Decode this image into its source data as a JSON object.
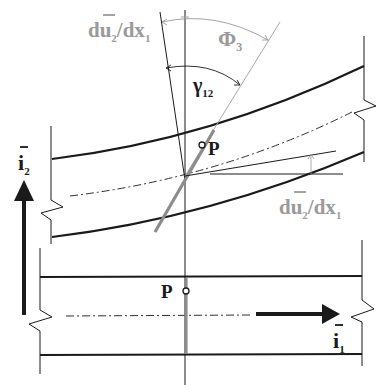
{
  "diagram": {
    "colors": {
      "line_dark": "#1a1a1a",
      "line_gray": "#9a9a9a",
      "normal_gray": "#8c8c8c",
      "background": "#ffffff"
    },
    "labels": {
      "slope_top": {
        "base": "du",
        "sub": "2",
        "rest": "/dx",
        "sub2": "1"
      },
      "slope_right": {
        "base": "du",
        "sub": "2",
        "rest": "/dx",
        "sub2": "1"
      },
      "phi": {
        "base": "Φ",
        "sub": "3"
      },
      "gamma": {
        "base": "γ",
        "sub": "12"
      },
      "point_deformed": "P",
      "point_undeformed": "P",
      "axis_i2": {
        "base": "i",
        "sub": "2"
      },
      "axis_i1": {
        "base": "i",
        "sub": "1"
      }
    },
    "panels": [
      {
        "name": "deformed-beam",
        "description": "Curved beam with rotated normal line through point P"
      },
      {
        "name": "undeformed-beam",
        "description": "Straight beam with vertical normal line through point P"
      }
    ]
  }
}
